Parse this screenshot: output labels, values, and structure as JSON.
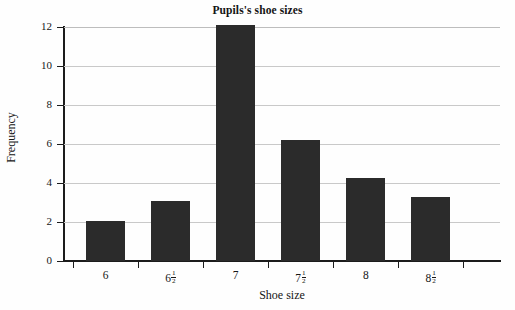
{
  "chart_data": {
    "type": "bar",
    "title": "Pupils's shoe sizes",
    "xlabel": "Shoe size",
    "ylabel": "Frequency",
    "categories": [
      "6",
      "6 1/2",
      "7",
      "7 1/2",
      "8",
      "8 1/2"
    ],
    "category_labels": [
      {
        "whole": "6",
        "numerator": "",
        "denominator": ""
      },
      {
        "whole": "6",
        "numerator": "1",
        "denominator": "2"
      },
      {
        "whole": "7",
        "numerator": "",
        "denominator": ""
      },
      {
        "whole": "7",
        "numerator": "1",
        "denominator": "2"
      },
      {
        "whole": "8",
        "numerator": "",
        "denominator": ""
      },
      {
        "whole": "8",
        "numerator": "1",
        "denominator": "2"
      }
    ],
    "values": [
      2.05,
      3.1,
      12.1,
      6.2,
      4.25,
      3.3
    ],
    "ylim": [
      0,
      12
    ],
    "ytick_values": [
      0,
      2,
      4,
      6,
      8,
      10,
      12
    ],
    "ytick_labels": [
      "0",
      "2",
      "4",
      "6",
      "8",
      "10",
      "12"
    ],
    "grid": true,
    "grid_axis": "y",
    "legend": null,
    "bar_color": "#2b2b2b",
    "grid_color": "#c9c9c9",
    "axis_color": "#1c1c1c",
    "background_color": "#fefefe"
  }
}
